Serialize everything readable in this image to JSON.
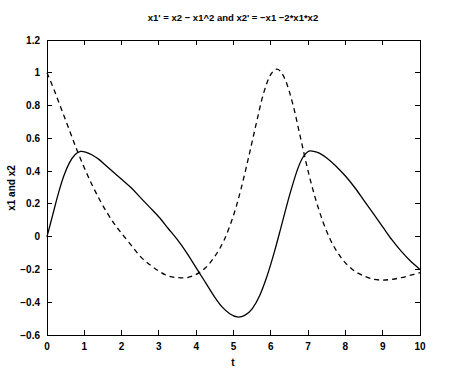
{
  "chart_data": {
    "type": "line",
    "title": "x1' = x2 − x1^2 and x2' = −x1 −2*x1*x2",
    "xlabel": "t",
    "ylabel": "x1 and x2",
    "xlim": [
      0,
      10
    ],
    "ylim": [
      -0.6,
      1.2
    ],
    "xticks": [
      "0",
      "1",
      "2",
      "3",
      "4",
      "5",
      "6",
      "7",
      "8",
      "9",
      "10"
    ],
    "xtick_values": [
      0,
      1,
      2,
      3,
      4,
      5,
      6,
      7,
      8,
      9,
      10
    ],
    "yticks": [
      "1.2",
      "1",
      "0.8",
      "0.6",
      "0.4",
      "0.2",
      "0",
      "−0.2",
      "−0.4",
      "−0.6"
    ],
    "ytick_values": [
      1.2,
      1,
      0.8,
      0.6,
      0.4,
      0.2,
      0,
      -0.2,
      -0.4,
      -0.6
    ],
    "grid": false,
    "legend": null,
    "box": true,
    "series": [
      {
        "name": "x1",
        "style": "solid",
        "color": "#000000",
        "x": [
          0,
          0.15,
          0.3,
          0.45,
          0.6,
          0.75,
          0.9,
          1.05,
          1.2,
          1.4,
          1.6,
          1.8,
          2.0,
          2.25,
          2.5,
          2.75,
          3.0,
          3.25,
          3.5,
          3.75,
          4.0,
          4.25,
          4.5,
          4.7,
          4.9,
          5.1,
          5.3,
          5.5,
          5.7,
          5.9,
          6.1,
          6.3,
          6.5,
          6.7,
          6.85,
          7.0,
          7.15,
          7.3,
          7.5,
          7.75,
          8.0,
          8.25,
          8.5,
          8.75,
          9.0,
          9.25,
          9.5,
          9.75,
          10.0
        ],
        "y": [
          0.0,
          0.13,
          0.26,
          0.37,
          0.45,
          0.5,
          0.52,
          0.515,
          0.5,
          0.47,
          0.43,
          0.39,
          0.35,
          0.3,
          0.24,
          0.18,
          0.12,
          0.05,
          -0.02,
          -0.1,
          -0.19,
          -0.28,
          -0.37,
          -0.43,
          -0.47,
          -0.49,
          -0.48,
          -0.44,
          -0.36,
          -0.24,
          -0.09,
          0.08,
          0.25,
          0.4,
          0.48,
          0.52,
          0.52,
          0.51,
          0.48,
          0.43,
          0.37,
          0.3,
          0.22,
          0.14,
          0.06,
          -0.02,
          -0.09,
          -0.15,
          -0.2
        ]
      },
      {
        "name": "x2",
        "style": "dashed",
        "color": "#000000",
        "x": [
          0,
          0.2,
          0.4,
          0.6,
          0.8,
          1.0,
          1.2,
          1.4,
          1.6,
          1.8,
          2.0,
          2.25,
          2.5,
          2.75,
          3.0,
          3.25,
          3.5,
          3.75,
          4.0,
          4.25,
          4.5,
          4.75,
          5.0,
          5.2,
          5.4,
          5.6,
          5.8,
          6.0,
          6.2,
          6.4,
          6.6,
          6.8,
          7.0,
          7.2,
          7.4,
          7.6,
          7.8,
          8.0,
          8.25,
          8.5,
          8.75,
          9.0,
          9.25,
          9.5,
          9.75,
          10.0
        ],
        "y": [
          1.0,
          0.89,
          0.77,
          0.65,
          0.53,
          0.42,
          0.32,
          0.23,
          0.15,
          0.08,
          0.02,
          -0.05,
          -0.12,
          -0.17,
          -0.21,
          -0.24,
          -0.25,
          -0.25,
          -0.23,
          -0.19,
          -0.12,
          -0.02,
          0.13,
          0.29,
          0.48,
          0.68,
          0.87,
          0.99,
          1.02,
          0.95,
          0.8,
          0.6,
          0.4,
          0.23,
          0.09,
          -0.02,
          -0.1,
          -0.16,
          -0.21,
          -0.24,
          -0.26,
          -0.265,
          -0.26,
          -0.25,
          -0.235,
          -0.22
        ]
      }
    ]
  }
}
